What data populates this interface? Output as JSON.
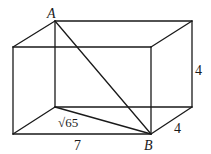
{
  "diagram": {
    "type": "rectangular-prism",
    "vertices": {
      "A": {
        "x": 55,
        "y": 21
      },
      "back_top_right": {
        "x": 192,
        "y": 21
      },
      "front_top_left": {
        "x": 13,
        "y": 47
      },
      "front_top_right": {
        "x": 151,
        "y": 47
      },
      "back_bottom_left": {
        "x": 55,
        "y": 107
      },
      "back_bottom_right": {
        "x": 192,
        "y": 107
      },
      "front_bottom_left": {
        "x": 13,
        "y": 134
      },
      "B": {
        "x": 151,
        "y": 134
      }
    },
    "labels": {
      "point_a": "A",
      "point_b": "B",
      "height": "4",
      "depth": "4",
      "length": "7",
      "floor_diagonal": "√65"
    }
  }
}
